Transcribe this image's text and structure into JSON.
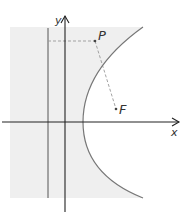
{
  "figure": {
    "type": "parabola-focus-directrix",
    "labels": {
      "x_axis": "x",
      "y_axis": "y",
      "point": "P",
      "focus": "F"
    },
    "colors": {
      "shading": "#efefef",
      "axis": "#222222",
      "curve": "#777777",
      "dashed": "#999999",
      "directrix": "#555555"
    }
  }
}
